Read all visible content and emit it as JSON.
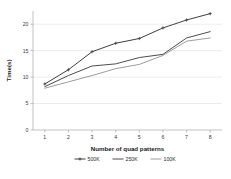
{
  "chart_data": {
    "type": "line",
    "title": "",
    "xlabel": "Number of quad patterns",
    "ylabel": "Time(s)",
    "x": [
      1,
      2,
      3,
      4,
      5,
      6,
      7,
      8
    ],
    "xtick_labels": [
      "1",
      "2",
      "3",
      "4",
      "5",
      "6",
      "7",
      "8"
    ],
    "ytick_labels": [
      "0",
      "5",
      "10",
      "15",
      "20"
    ],
    "yticks": [
      0,
      5,
      10,
      15,
      20
    ],
    "ylim": [
      0,
      22.5
    ],
    "xlim": [
      0.5,
      8.5
    ],
    "grid": true,
    "legend_position": "bottom",
    "series": [
      {
        "name": "500K",
        "color": "#404040",
        "marker": "plus",
        "values": [
          8.7,
          11.4,
          14.8,
          16.4,
          17.3,
          19.3,
          20.8,
          22.0
        ]
      },
      {
        "name": "250K",
        "color": "#4d4d4d",
        "marker": "none",
        "values": [
          8.2,
          10.3,
          12.1,
          12.5,
          13.7,
          14.3,
          17.4,
          18.6
        ]
      },
      {
        "name": "100K",
        "color": "#8a8a8a",
        "marker": "none",
        "values": [
          7.9,
          9.1,
          10.3,
          11.6,
          12.4,
          14.1,
          16.8,
          17.4
        ]
      }
    ]
  },
  "legend": {
    "entries": [
      {
        "label": "500K"
      },
      {
        "label": "250K"
      },
      {
        "label": "100K"
      }
    ]
  },
  "axes": {
    "x_title": "Number of quad patterns",
    "y_title": "Time(s)"
  }
}
